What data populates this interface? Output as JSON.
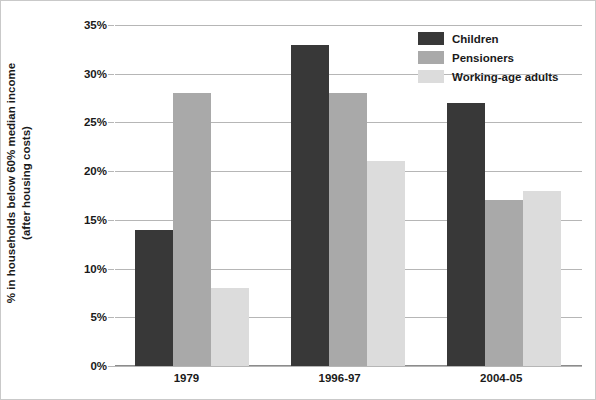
{
  "chart_data": {
    "type": "bar",
    "title": "",
    "subtitle": "",
    "xlabel": "",
    "ylabel_line1": "% in households below 60% median income",
    "ylabel_line2": "(after housing costs)",
    "categories": [
      "1979",
      "1996-97",
      "2004-05"
    ],
    "series": [
      {
        "name": "Children",
        "values": [
          14,
          33,
          27
        ],
        "color": "#383838"
      },
      {
        "name": "Pensioners",
        "values": [
          28,
          28,
          17
        ],
        "color": "#a9a9a9"
      },
      {
        "name": "Working-age adults",
        "values": [
          8,
          21,
          18
        ],
        "color": "#dcdcdc"
      }
    ],
    "ylim": [
      0,
      35
    ],
    "ytick_values": [
      35,
      30,
      25,
      20,
      15,
      10,
      5,
      0
    ],
    "ytick_labels": [
      "35%",
      "30%",
      "25%",
      "20%",
      "15%",
      "10%",
      "5%",
      "0%"
    ],
    "grid": true,
    "grid_axis": "y",
    "legend_position": "top-right",
    "legend_entries": [
      "Children",
      "Pensioners",
      "Working-age adults"
    ],
    "annotations": []
  }
}
